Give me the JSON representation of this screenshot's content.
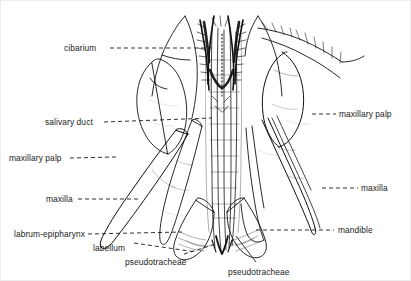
{
  "figure": {
    "caption_present": false,
    "background_color": "#ffffff",
    "ink_color": "#111111",
    "label_color": "#1a1a1a",
    "width": 411,
    "height": 281
  },
  "labels": [
    {
      "id": "cibarium",
      "text": "cibarium",
      "side": "left",
      "x": 64,
      "y": 44
    },
    {
      "id": "salivary-duct",
      "text": "salivary duct",
      "side": "left",
      "x": 45,
      "y": 118
    },
    {
      "id": "maxillary-palp-l",
      "text": "maxillary palp",
      "side": "left",
      "x": 9,
      "y": 154
    },
    {
      "id": "maxilla-l",
      "text": "maxilla",
      "side": "left",
      "x": 46,
      "y": 195
    },
    {
      "id": "labrum-epipharynx",
      "text": "labrum-epipharynx",
      "side": "left",
      "x": 14,
      "y": 230
    },
    {
      "id": "labellum",
      "text": "labellum",
      "side": "left",
      "x": 93,
      "y": 244
    },
    {
      "id": "pseudotracheae-l",
      "text": "pseudotracheae",
      "side": "left",
      "x": 125,
      "y": 258
    },
    {
      "id": "pseudotracheae-r",
      "text": "pseudotracheae",
      "side": "left",
      "x": 228,
      "y": 268
    },
    {
      "id": "maxillary-palp-r",
      "text": "maxillary palp",
      "side": "right",
      "x": 339,
      "y": 110
    },
    {
      "id": "maxilla-r",
      "text": "maxilla",
      "side": "right",
      "x": 361,
      "y": 184
    },
    {
      "id": "mandible",
      "text": "mandible",
      "side": "right",
      "x": 338,
      "y": 226
    }
  ],
  "leader_lines": [
    {
      "id": "leader-cibarium",
      "style": "dashed",
      "points": "110,48 215,48"
    },
    {
      "id": "leader-salivary-duct",
      "style": "dashed",
      "points": "104,122 212,118"
    },
    {
      "id": "leader-maxillary-palp-l",
      "style": "dashed",
      "points": "70,158 116,157"
    },
    {
      "id": "leader-maxilla-l",
      "style": "dashed",
      "points": "78,199 140,199"
    },
    {
      "id": "leader-labrum-epipharynx",
      "style": "dashed",
      "points": "88,234 182,232"
    },
    {
      "id": "leader-labellum",
      "style": "dashed",
      "points": "134,243 196,252"
    },
    {
      "id": "leader-pseudotracheae-l",
      "style": "dashed",
      "points": "184,254 216,244"
    },
    {
      "id": "leader-pseudotracheae-r",
      "style": "solid",
      "points": "256,262 236,236"
    },
    {
      "id": "leader-maxillary-palp-r",
      "style": "dashed",
      "points": "312,114 336,114"
    },
    {
      "id": "leader-maxilla-r",
      "style": "dashed",
      "points": "322,188 358,188"
    },
    {
      "id": "leader-mandible",
      "style": "dashed",
      "points": "256,230 334,230"
    }
  ]
}
